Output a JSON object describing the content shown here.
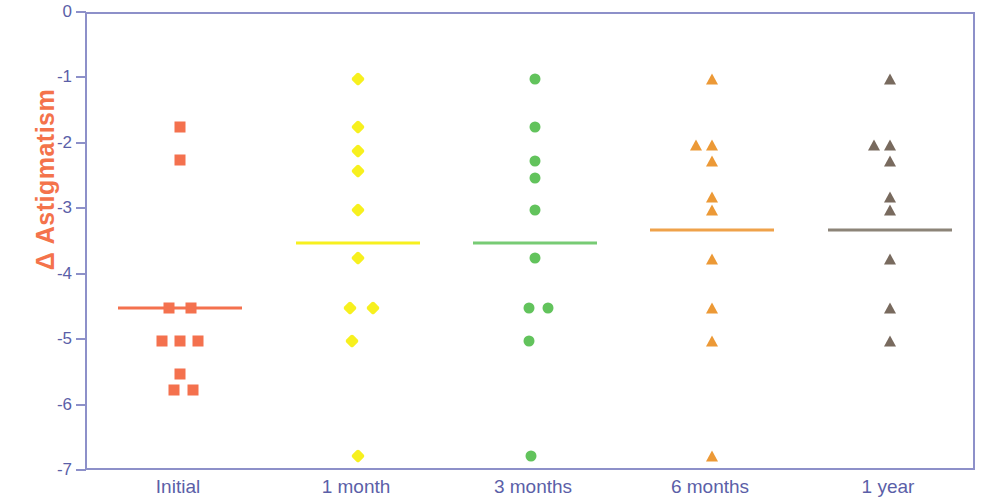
{
  "chart_data": {
    "type": "scatter",
    "title": "",
    "xlabel": "",
    "ylabel": "Δ Astigmatism",
    "ylim": [
      -7,
      0
    ],
    "yticks": [
      0,
      -1,
      -2,
      -3,
      -4,
      -5,
      -6,
      -7
    ],
    "ytick_labels": [
      "0",
      "-1",
      "-2",
      "-3",
      "-4",
      "-5",
      "-6",
      "-7"
    ],
    "categories": [
      "Initial",
      "1 month",
      "3 months",
      "6 months",
      "1 year"
    ],
    "grid": false,
    "legend": false,
    "series": [
      {
        "name": "Initial",
        "category": "Initial",
        "marker": "square",
        "color": "#F4714E",
        "mean": -4.5,
        "mean_line_color": "#F4714E",
        "points": [
          {
            "offset": 0,
            "value": -1.73
          },
          {
            "offset": 0,
            "value": -2.23
          },
          {
            "offset": -11,
            "value": -4.5
          },
          {
            "offset": 11,
            "value": -4.5
          },
          {
            "offset": -18,
            "value": -5.0
          },
          {
            "offset": 0,
            "value": -5.0
          },
          {
            "offset": 18,
            "value": -5.0
          },
          {
            "offset": 0,
            "value": -5.5
          },
          {
            "offset": -6,
            "value": -5.75
          },
          {
            "offset": 13,
            "value": -5.75
          }
        ]
      },
      {
        "name": "1 month",
        "category": "1 month",
        "marker": "diamond",
        "color": "#F7F01E",
        "mean": -3.5,
        "mean_line_color": "#F7F01E",
        "points": [
          {
            "offset": 0,
            "value": -1.0
          },
          {
            "offset": 0,
            "value": -1.73
          },
          {
            "offset": 0,
            "value": -2.1
          },
          {
            "offset": 0,
            "value": -2.4
          },
          {
            "offset": 0,
            "value": -3.0
          },
          {
            "offset": 0,
            "value": -3.73
          },
          {
            "offset": -8,
            "value": -4.5
          },
          {
            "offset": 15,
            "value": -4.5
          },
          {
            "offset": -6,
            "value": -5.0
          },
          {
            "offset": 0,
            "value": -6.75
          }
        ]
      },
      {
        "name": "3 months",
        "category": "3 months",
        "marker": "circle",
        "color": "#62C35C",
        "mean": -3.5,
        "mean_line_color": "#77CB74",
        "points": [
          {
            "offset": 0,
            "value": -1.0
          },
          {
            "offset": 0,
            "value": -1.73
          },
          {
            "offset": 0,
            "value": -2.25
          },
          {
            "offset": 0,
            "value": -2.5
          },
          {
            "offset": 0,
            "value": -3.0
          },
          {
            "offset": 0,
            "value": -3.73
          },
          {
            "offset": -6,
            "value": -4.5
          },
          {
            "offset": 13,
            "value": -4.5
          },
          {
            "offset": -6,
            "value": -5.0
          },
          {
            "offset": -4,
            "value": -6.75
          }
        ]
      },
      {
        "name": "6 months",
        "category": "6 months",
        "marker": "triangle",
        "color": "#EC9936",
        "mean": -3.3,
        "mean_line_color": "#EFA24A",
        "points": [
          {
            "offset": 0,
            "value": -1.0
          },
          {
            "offset": -16,
            "value": -2.0
          },
          {
            "offset": 0,
            "value": -2.0
          },
          {
            "offset": 0,
            "value": -2.25
          },
          {
            "offset": 0,
            "value": -2.8
          },
          {
            "offset": 0,
            "value": -3.0
          },
          {
            "offset": 0,
            "value": -3.75
          },
          {
            "offset": 0,
            "value": -4.5
          },
          {
            "offset": 0,
            "value": -5.0
          },
          {
            "offset": 0,
            "value": -6.75
          }
        ]
      },
      {
        "name": "1 year",
        "category": "1 year",
        "marker": "triangle",
        "color": "#786A5E",
        "mean": -3.3,
        "mean_line_color": "#8c8478",
        "points": [
          {
            "offset": 0,
            "value": -1.0
          },
          {
            "offset": -16,
            "value": -2.0
          },
          {
            "offset": 0,
            "value": -2.0
          },
          {
            "offset": 0,
            "value": -2.25
          },
          {
            "offset": 0,
            "value": -2.8
          },
          {
            "offset": 0,
            "value": -3.0
          },
          {
            "offset": 0,
            "value": -3.75
          },
          {
            "offset": 0,
            "value": -4.5
          },
          {
            "offset": 0,
            "value": -5.0
          }
        ]
      }
    ]
  },
  "axis_style": {
    "frame_color": "#8d90c9",
    "tick_label_color": "#5b5fa8",
    "xlabel_color": "#5b5fa8",
    "ylabel_color": "#F4734B"
  },
  "geometry": {
    "plot_left": 85,
    "plot_right": 975,
    "plot_top": 12,
    "plot_bottom": 470,
    "y_top_value": 0,
    "y_bottom_value": -7,
    "category_x": [
      178,
      356,
      533,
      710,
      888
    ],
    "mean_line_half_width": 62
  }
}
